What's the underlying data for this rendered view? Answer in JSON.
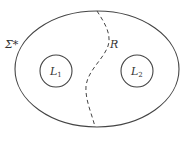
{
  "diagram": {
    "type": "set-partition",
    "colors": {
      "stroke": "#444444",
      "text": "#333333",
      "background": "#ffffff"
    },
    "universe": {
      "label": "Σ*",
      "shape": "ellipse"
    },
    "boundary": {
      "label": "R",
      "style": "dashed"
    },
    "regions": [
      {
        "label": "L",
        "subscript": "1"
      },
      {
        "label": "L",
        "subscript": "2"
      }
    ]
  }
}
